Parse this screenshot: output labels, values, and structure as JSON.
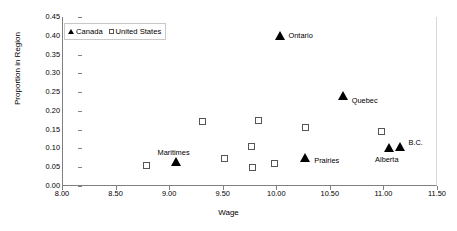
{
  "chart_data": {
    "type": "scatter",
    "title": "",
    "xlabel": "Wage",
    "ylabel": "Proportion in Region",
    "xlim": [
      8.0,
      11.5
    ],
    "ylim": [
      0.0,
      0.45
    ],
    "xticks": [
      "8.00",
      "8.50",
      "9.00",
      "9.50",
      "10.00",
      "10.50",
      "11.00",
      "11.50"
    ],
    "xtick_values": [
      8.0,
      8.5,
      9.0,
      9.5,
      10.0,
      10.5,
      11.0,
      11.5
    ],
    "yticks": [
      "0.00",
      "0.05",
      "0.10",
      "0.15",
      "0.20",
      "0.25",
      "0.30",
      "0.35",
      "0.40",
      "0.45"
    ],
    "ytick_values": [
      0.0,
      0.05,
      0.1,
      0.15,
      0.2,
      0.25,
      0.3,
      0.35,
      0.4,
      0.45
    ],
    "grid": false,
    "legend_position": "top-left",
    "marker_color": "#000000",
    "axis_color": "#808080",
    "series": [
      {
        "name": "Canada",
        "marker": "filled-triangle",
        "points": [
          {
            "label": "Maritimes",
            "x": 9.06,
            "y": 0.065,
            "label_dx": -2,
            "label_dy": -13,
            "label_align": "center"
          },
          {
            "label": "Ontario",
            "x": 10.03,
            "y": 0.4,
            "label_dx": 9,
            "label_dy": -4,
            "label_align": "left"
          },
          {
            "label": "Quebec",
            "x": 10.62,
            "y": 0.24,
            "label_dx": 9,
            "label_dy": 1,
            "label_align": "left"
          },
          {
            "label": "Prairies",
            "x": 10.27,
            "y": 0.075,
            "label_dx": 9,
            "label_dy": -1,
            "label_align": "left"
          },
          {
            "label": "Alberta",
            "x": 11.05,
            "y": 0.1,
            "label_dx": -2,
            "label_dy": 8,
            "label_align": "center"
          },
          {
            "label": "B.C.",
            "x": 11.15,
            "y": 0.103,
            "label_dx": 9,
            "label_dy": -8,
            "label_align": "left"
          }
        ]
      },
      {
        "name": "United States",
        "marker": "open-square",
        "points": [
          {
            "label": "",
            "x": 8.79,
            "y": 0.055
          },
          {
            "label": "",
            "x": 9.31,
            "y": 0.172
          },
          {
            "label": "",
            "x": 9.52,
            "y": 0.073
          },
          {
            "label": "",
            "x": 9.77,
            "y": 0.105
          },
          {
            "label": "",
            "x": 9.78,
            "y": 0.05
          },
          {
            "label": "",
            "x": 9.83,
            "y": 0.175
          },
          {
            "label": "",
            "x": 9.98,
            "y": 0.06
          },
          {
            "label": "",
            "x": 10.27,
            "y": 0.155
          },
          {
            "label": "",
            "x": 10.98,
            "y": 0.145
          }
        ]
      }
    ]
  },
  "legend": {
    "entries": [
      {
        "label": "Canada",
        "marker": "filled-triangle"
      },
      {
        "label": "United States",
        "marker": "open-square"
      }
    ]
  }
}
